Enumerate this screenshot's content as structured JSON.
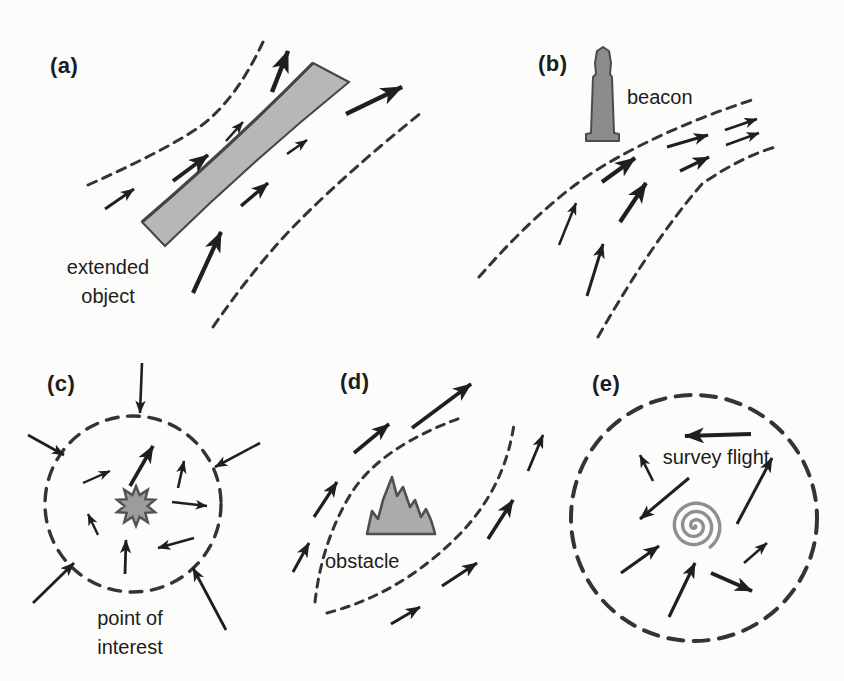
{
  "canvas": {
    "width": 844,
    "height": 681,
    "background": "#fcfcfa",
    "ink": "#1f1f1f",
    "dash_color": "#343434"
  },
  "panels": {
    "a": {
      "label": "(a)",
      "caption": "extended object",
      "dashes": [
        {
          "d": "M 88 185 Q 162 152 198 128 Q 235 102 263 42",
          "dash": "9 7",
          "w": 3
        },
        {
          "d": "M 213 327 Q 258 262 300 220 Q 352 168 421 113",
          "dash": "9 7",
          "w": 3
        }
      ],
      "band": {
        "fill_path": "M 313 63 L 349 82 Q 253 160 165 246 L 142 222 Q 231 146 313 63 Z",
        "edge_path": "M 142 222 Q 231 146 313 63",
        "fill": "#b7b7b7",
        "stroke": "#454545"
      },
      "arrows": [
        [
          105,
          209,
          134,
          189,
          2.8
        ],
        [
          173,
          181,
          208,
          155,
          4.0
        ],
        [
          226,
          141,
          243,
          122,
          2.5
        ],
        [
          272,
          92,
          288,
          51,
          4.5
        ],
        [
          346,
          114,
          402,
          87,
          4.5
        ],
        [
          287,
          154,
          307,
          140,
          2.5
        ],
        [
          241,
          206,
          268,
          183,
          3.5
        ],
        [
          193,
          293,
          221,
          232,
          4.2
        ]
      ]
    },
    "b": {
      "label": "(b)",
      "caption": "beacon",
      "dashes": [
        {
          "d": "M 479 277 Q 548 198 608 163 Q 672 126 752 100",
          "dash": "9 7",
          "w": 3
        },
        {
          "d": "M 598 337 Q 652 242 702 184 Q 742 156 779 146",
          "dash": "9 7",
          "w": 3
        }
      ],
      "beacon": {
        "path": "M 586 141 L 586 134 L 591 133 L 593 77 L 596 74 L 595 63 L 597 51 L 603 47 L 609 51 L 611 63 L 610 74 L 612 77 L 614 133 L 619 134 L 619 141 Z",
        "fill": "#8c8c8c",
        "stroke": "#4b4b4b"
      },
      "arrows": [
        [
          559,
          245,
          576,
          203,
          2.5
        ],
        [
          587,
          296,
          603,
          244,
          3.0
        ],
        [
          602,
          182,
          635,
          158,
          4.2
        ],
        [
          620,
          222,
          646,
          183,
          4.2
        ],
        [
          667,
          147,
          708,
          135,
          3.0
        ],
        [
          680,
          171,
          709,
          157,
          3.4
        ],
        [
          725,
          130,
          757,
          119,
          2.6
        ],
        [
          726,
          145,
          759,
          133,
          2.6
        ]
      ]
    },
    "c": {
      "label": "(c)",
      "caption": "point of interest",
      "circle": {
        "cx": 133,
        "cy": 504,
        "r": 88,
        "dash": "12 9.5",
        "w": 3.4
      },
      "star": {
        "cx": 136,
        "cy": 506,
        "points": 10,
        "outer": 20,
        "inner": 11.5,
        "rotation": -90,
        "fill": "#9c9c9c",
        "stroke": "#535353"
      },
      "arrows": [
        [
          142,
          363,
          140,
          413,
          2.6
        ],
        [
          28,
          435,
          64,
          455,
          2.6
        ],
        [
          260,
          443,
          215,
          467,
          2.6
        ],
        [
          33,
          603,
          74,
          563,
          2.8
        ],
        [
          226,
          630,
          193,
          568,
          2.8
        ],
        [
          83,
          483,
          110,
          471,
          2.4
        ],
        [
          130,
          486,
          153,
          446,
          3.6
        ],
        [
          178,
          488,
          184,
          461,
          2.6
        ],
        [
          172,
          502,
          207,
          506,
          2.4
        ],
        [
          194,
          538,
          158,
          548,
          2.6
        ],
        [
          98,
          535,
          88,
          514,
          2.4
        ],
        [
          125,
          574,
          126,
          540,
          2.8
        ]
      ]
    },
    "d": {
      "label": "(d)",
      "caption": "obstacle",
      "dashes": [
        {
          "d": "M 315 602 Q 322 540 352 492 Q 382 446 463 417",
          "dash": "8 7",
          "w": 3
        },
        {
          "d": "M 327 613 Q 400 594 458 536 Q 505 488 514 424",
          "dash": "8 7",
          "w": 3
        }
      ],
      "mountain": {
        "points": "367,534 372,511 378,519 383,500 392,477 397,496 403,487 410,507 415,500 421,517 426,509 431,520 434,530 435,534",
        "fill": "#ababab",
        "stroke": "#4f4f4f"
      },
      "arrows": [
        [
          412,
          428,
          471,
          384,
          3.8
        ],
        [
          354,
          453,
          389,
          424,
          3.6
        ],
        [
          314,
          517,
          337,
          482,
          3.2
        ],
        [
          293,
          572,
          309,
          543,
          3.0
        ],
        [
          528,
          471,
          543,
          435,
          2.8
        ],
        [
          488,
          539,
          513,
          500,
          3.6
        ],
        [
          442,
          586,
          477,
          563,
          3.2
        ],
        [
          391,
          624,
          420,
          607,
          3.0
        ]
      ]
    },
    "e": {
      "label": "(e)",
      "caption": "survey flight",
      "circle": {
        "cx": 694,
        "cy": 518,
        "r": 123,
        "dash": "15 10.5",
        "w": 4
      },
      "spiral": {
        "cx": 695,
        "cy": 526,
        "r": 26,
        "turns": 3.15,
        "stroke": "#8f8f8f",
        "w": 3.4
      },
      "arrows": [
        [
          751,
          434,
          685,
          436,
          4.0
        ],
        [
          653,
          481,
          640,
          455,
          2.6
        ],
        [
          689,
          478,
          640,
          519,
          3.0
        ],
        [
          737,
          524,
          772,
          458,
          3.0
        ],
        [
          621,
          573,
          659,
          546,
          3.2
        ],
        [
          669,
          617,
          695,
          563,
          3.2
        ],
        [
          711,
          573,
          752,
          591,
          3.6
        ],
        [
          744,
          563,
          767,
          543,
          2.6
        ]
      ]
    }
  }
}
